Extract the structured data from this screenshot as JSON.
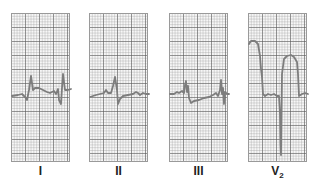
{
  "figure": {
    "type": "ECG lead strips",
    "trace_color": "#7d7d7d",
    "grid_color": "#9a9a9a",
    "leads": [
      {
        "label": "I",
        "description": "Small complexes, near baseline"
      },
      {
        "label": "II",
        "description": "Small upright QRS, near baseline"
      },
      {
        "label": "III",
        "description": "Low amplitude complexes, near baseline"
      },
      {
        "label": "V",
        "subscript": "2",
        "description": "Marked ST elevation with deep S wave"
      }
    ]
  }
}
